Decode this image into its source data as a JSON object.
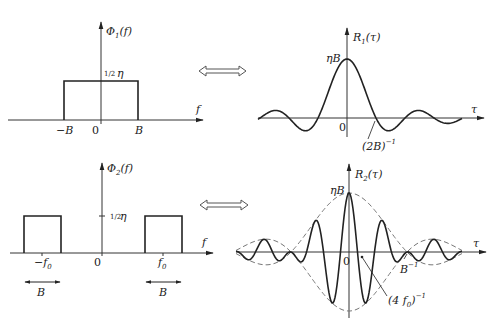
{
  "figure": {
    "panel1_left": {
      "y_label": "Φ",
      "y_label_sub": "1",
      "y_label_arg": "(f)",
      "level_label_frac": "1/2",
      "level_label_sym": "η",
      "x_axis_label": "f",
      "ticks": [
        "−B",
        "0",
        "B"
      ]
    },
    "panel1_right": {
      "y_label": "R",
      "y_label_sub": "1",
      "y_label_arg": "(τ)",
      "peak_label": "ηB",
      "x_axis_label": "τ",
      "origin_label": "0",
      "zero_annotation": "(2B)",
      "zero_annotation_exp": "−1"
    },
    "panel2_left": {
      "y_label": "Φ",
      "y_label_sub": "2",
      "y_label_arg": "(f)",
      "level_label_frac": "1/2",
      "level_label_sym": "η",
      "x_axis_label": "f",
      "ticks": [
        "−f",
        "0",
        "f"
      ],
      "tick_sub": "0",
      "bandwidth_label_left": "B",
      "bandwidth_label_right": "B"
    },
    "panel2_right": {
      "y_label": "R",
      "y_label_sub": "2",
      "y_label_arg": "(τ)",
      "peak_label": "ηB",
      "x_axis_label": "τ",
      "origin_label": "0",
      "envelope_annotation": "B",
      "envelope_annotation_exp": "−1",
      "carrier_annotation": "(4 f",
      "carrier_annotation_sub": "0",
      "carrier_annotation_close": ")",
      "carrier_annotation_exp": "−1"
    },
    "transform_arrow_icon": "double-arrow-icon"
  }
}
